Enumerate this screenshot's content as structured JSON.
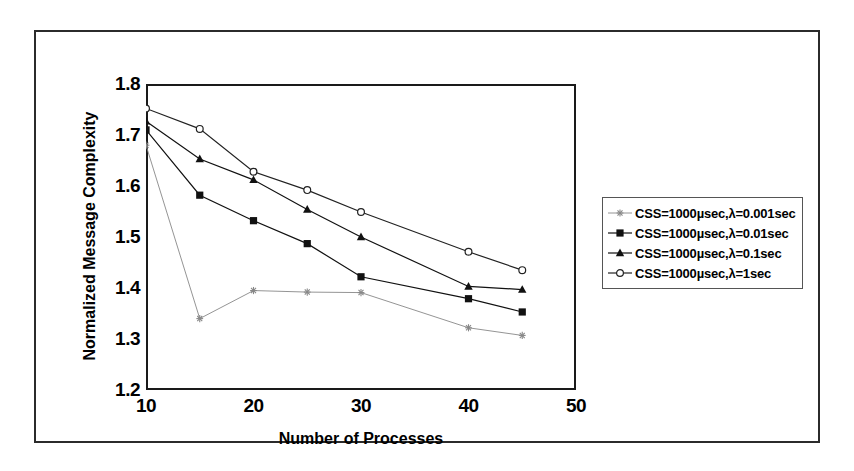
{
  "chart_data": {
    "type": "line",
    "title": "",
    "xlabel": "Number of Processes",
    "ylabel": "Normalized Message Complexity",
    "xlim": [
      10,
      50
    ],
    "ylim": [
      1.2,
      1.8
    ],
    "xticks": [
      10,
      20,
      30,
      40,
      50
    ],
    "xtick_labels": [
      "10",
      "20",
      "30",
      "40",
      "50"
    ],
    "yticks": [
      1.2,
      1.3,
      1.4,
      1.5,
      1.6,
      1.7,
      1.8
    ],
    "ytick_labels": [
      "1.2",
      "1.3",
      "1.4",
      "1.5",
      "1.6",
      "1.7",
      "1.8"
    ],
    "grid": false,
    "legend_position": "right",
    "x": [
      10,
      15,
      20,
      25,
      30,
      40,
      45
    ],
    "series": [
      {
        "name": "CSS=1000µsec,λ=0.001sec",
        "marker": "star",
        "color": "#888888",
        "values": [
          1.68,
          1.34,
          1.395,
          1.392,
          1.391,
          1.322,
          1.307
        ]
      },
      {
        "name": "CSS=1000µsec,λ=0.01sec",
        "marker": "filled-square",
        "color": "#111111",
        "values": [
          1.71,
          1.582,
          1.532,
          1.487,
          1.422,
          1.379,
          1.353
        ]
      },
      {
        "name": "CSS=1000µsec,λ=0.1sec",
        "marker": "filled-triangle",
        "color": "#111111",
        "values": [
          1.727,
          1.653,
          1.612,
          1.554,
          1.5,
          1.403,
          1.397
        ]
      },
      {
        "name": "CSS=1000µsec,λ=1sec",
        "marker": "open-circle",
        "color": "#222222",
        "values": [
          1.752,
          1.712,
          1.628,
          1.592,
          1.549,
          1.471,
          1.435
        ]
      }
    ]
  },
  "legend": {
    "entries": [
      {
        "label": "CSS=1000µsec,λ=0.001sec"
      },
      {
        "label": "CSS=1000µsec,λ=0.01sec"
      },
      {
        "label": "CSS=1000µsec,λ=0.1sec"
      },
      {
        "label": "CSS=1000µsec,λ=1sec"
      }
    ]
  },
  "axes": {
    "x_title": "Number of Processes",
    "y_title": "Normalized Message Complexity"
  }
}
